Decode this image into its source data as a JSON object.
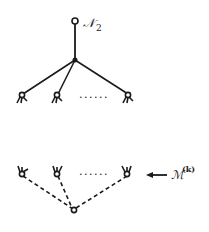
{
  "diagram": {
    "upper_tree": {
      "root_label": "𝒩",
      "root_subscript": "2",
      "ellipsis": "......",
      "edge_style": "solid",
      "leaf_count_visible": 3
    },
    "lower_group": {
      "label": "ℳ",
      "label_superscript": "(k)",
      "ellipsis": "......",
      "edge_style": "dashed",
      "leaf_count_visible": 3,
      "arrow": "left-arrow"
    },
    "colors": {
      "ink": "#1a1a1a",
      "background": "#ffffff"
    }
  }
}
